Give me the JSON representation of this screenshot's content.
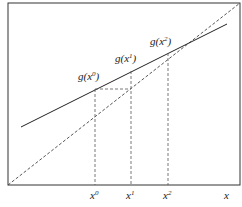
{
  "diagram": {
    "frame": {
      "x1": 8,
      "y1": 3,
      "x2": 240,
      "y2": 185,
      "color": "#333333"
    },
    "identity_line": {
      "label": "y = x",
      "x1": 8,
      "y1": 185,
      "x2": 240,
      "y2": 3,
      "style": "dashed"
    },
    "g_line": {
      "label": "g(x)",
      "x1": 21,
      "y1": 127,
      "x2": 227,
      "y2": 24,
      "style": "solid"
    },
    "axis_label_x": "x",
    "iterates": [
      {
        "name": "x0",
        "base": "x",
        "sup": "0",
        "gbase": "g(x",
        "gclose": ")",
        "x": 95,
        "gy": 89
      },
      {
        "name": "x1",
        "base": "x",
        "sup": "1",
        "gbase": "g(x",
        "gclose": ")",
        "x": 131,
        "gy": 71
      },
      {
        "name": "x2",
        "base": "x",
        "sup": "2",
        "gbase": "g(x",
        "gclose": ")",
        "x": 168,
        "gy": 53
      }
    ],
    "fixed_point": {
      "x": 201,
      "y": 37
    }
  }
}
